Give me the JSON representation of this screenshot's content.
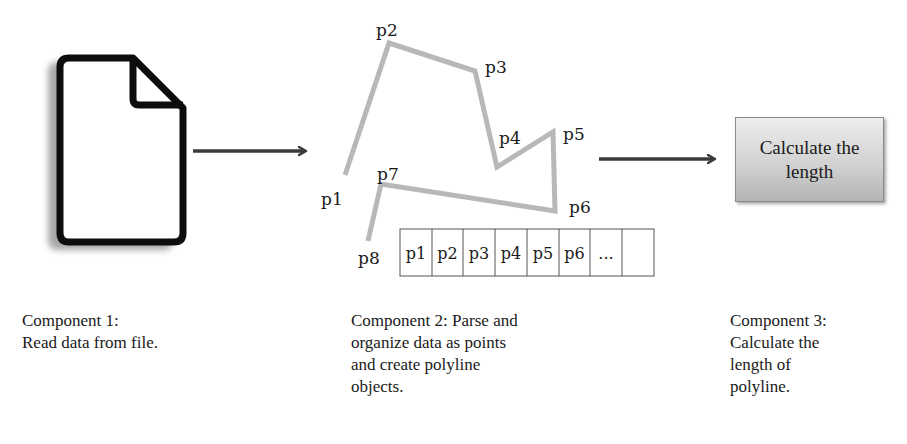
{
  "diagram": {
    "components": [
      {
        "id": "component-1",
        "icon": "document-file-icon",
        "caption": "Component 1:\nRead data from file."
      },
      {
        "id": "component-2",
        "caption": "Component 2: Parse and\norganize data as points\nand create polyline\nobjects.",
        "polyline": {
          "points": [
            {
              "label": "p1"
            },
            {
              "label": "p2"
            },
            {
              "label": "p3"
            },
            {
              "label": "p4"
            },
            {
              "label": "p5"
            },
            {
              "label": "p6"
            },
            {
              "label": "p7"
            },
            {
              "label": "p8"
            }
          ]
        },
        "array_cells": [
          "p1",
          "p2",
          "p3",
          "p4",
          "p5",
          "p6",
          "...",
          ""
        ]
      },
      {
        "id": "component-3",
        "box_label": "Calculate the length",
        "caption": "Component 3:\nCalculate the\nlength of\npolyline."
      }
    ],
    "arrows": [
      {
        "from": "component-1",
        "to": "component-2"
      },
      {
        "from": "component-2",
        "to": "component-3"
      }
    ],
    "colors": {
      "polyline": "#b8b8b8",
      "arrow": "#3a3a3a",
      "icon_outline": "#0d0d0d",
      "box_gradient_top": "#ededed",
      "box_gradient_bottom": "#b4b4b4"
    }
  }
}
